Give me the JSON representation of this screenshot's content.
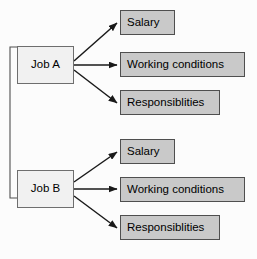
{
  "diagram": {
    "background_color": "#fcfcfc",
    "job_box_color": "#f1f1f1",
    "attribute_box_color": "#c9c9c9",
    "border_color": "#4f4f4f",
    "arrow_color": "#1a1a1a",
    "groups": [
      {
        "id": "group-a",
        "source": {
          "label": "Job A"
        },
        "attributes": [
          {
            "label": "Salary"
          },
          {
            "label": "Working conditions"
          },
          {
            "label": "Responsiblities"
          }
        ]
      },
      {
        "id": "group-b",
        "source": {
          "label": "Job B"
        },
        "attributes": [
          {
            "label": "Salary"
          },
          {
            "label": "Working conditions"
          },
          {
            "label": "Responsiblities"
          }
        ]
      }
    ],
    "connector": {
      "label": "job-link-connector"
    }
  }
}
